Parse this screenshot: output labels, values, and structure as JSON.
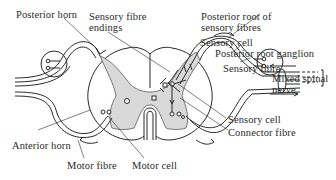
{
  "diagram": {
    "labels": {
      "posterior_horn": "Posterior horn",
      "sensory_fibre_endings_1": "Sensory fibre",
      "sensory_fibre_endings_2": "endings",
      "posterior_root_1": "Posterior root of",
      "posterior_root_2": "sensory fibres",
      "sensory_cell_top": "Sensory cell",
      "posterior_root_ganglion": "Posterior root ganglion",
      "sensory_fibre": "Sensory fibre",
      "mixed_spinal_1": "Mixed spinal",
      "mixed_spinal_2": "nerve",
      "sensory_cell_bottom": "Sensory cell",
      "connector_fibre": "Connector fibre",
      "anterior_horn": "Anterior horn",
      "motor_fibre": "Motor fibre",
      "motor_cell": "Motor cell"
    },
    "colors": {
      "line": "#2a2a2a",
      "gray_matter": "#d9d9d9",
      "background": "#ffffff"
    }
  }
}
